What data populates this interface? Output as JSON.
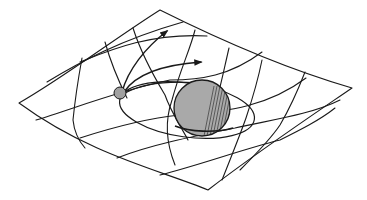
{
  "figure": {
    "colors": {
      "background": "#ffffff",
      "ink": "#1a1a1a",
      "large_sphere_fill": "#a9a9a9",
      "small_sphere_fill": "#a0a0a0"
    },
    "elements": {
      "sheet": "warped-grid-sheet",
      "large_mass": "large-sphere",
      "small_mass": "small-sphere",
      "orbit": "elliptical-orbit",
      "trajectories": [
        "trajectory-arrow-upper",
        "trajectory-arrow-lower"
      ]
    }
  }
}
